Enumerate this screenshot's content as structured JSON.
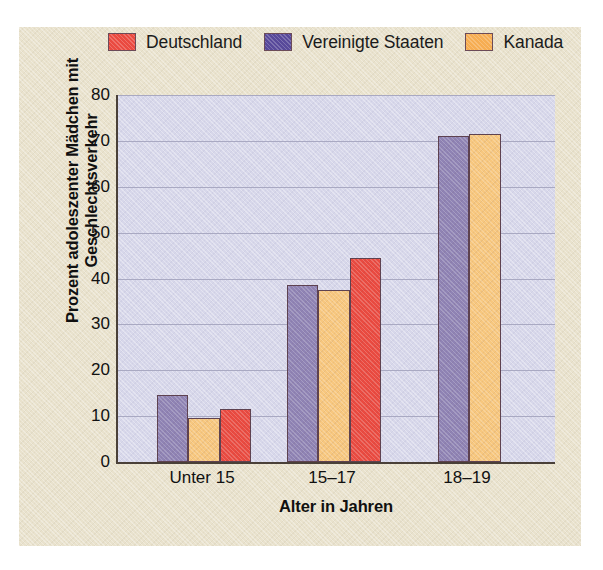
{
  "chart_data": {
    "type": "bar",
    "title": "",
    "xlabel": "Alter in Jahren",
    "ylabel_line1": "Prozent adoleszenter Mädchen mit",
    "ylabel_line2": "Geschlechtsverkehr",
    "categories": [
      "Unter 15",
      "15–17",
      "18–19"
    ],
    "yticks": [
      0,
      10,
      20,
      30,
      40,
      50,
      60,
      70,
      80
    ],
    "ylim": [
      0,
      80
    ],
    "grid": true,
    "legend_position": "top",
    "bar_order_in_group": [
      "Vereinigte Staaten",
      "Kanada",
      "Deutschland"
    ],
    "series": [
      {
        "name": "Deutschland",
        "color": "#ea4a40",
        "values": [
          11.5,
          44.5,
          null
        ]
      },
      {
        "name": "Vereinigte Staaten",
        "color": "#6b5aa0",
        "values": [
          14.5,
          38.5,
          71.0
        ]
      },
      {
        "name": "Kanada",
        "color": "#f4b25c",
        "values": [
          9.5,
          37.5,
          71.5
        ]
      }
    ]
  },
  "legend": {
    "items": [
      {
        "label": "Deutschland",
        "color": "#ea4a40"
      },
      {
        "label": "Vereinigte Staaten",
        "color": "#58499a"
      },
      {
        "label": "Kanada",
        "color": "#f6ad52"
      }
    ]
  },
  "axes": {
    "y_title_line1": "Prozent adoleszenter Mädchen mit",
    "y_title_line2": "Geschlechtsverkehr",
    "x_title": "Alter in Jahren",
    "y_ticks": [
      "80",
      "70",
      "60",
      "50",
      "40",
      "30",
      "20",
      "10",
      "0"
    ],
    "x_ticks": [
      "Unter 15",
      "15–17",
      "18–19"
    ]
  },
  "colors": {
    "panel_background": "#e9e2cd",
    "plot_background": "#d7d7ea",
    "axis_line": "#4a4038",
    "gridline": "#a9a9c2",
    "bar_outline": "#5e4250",
    "germany": "#ea4a40",
    "usa": "#8f83b4",
    "canada": "#f7c77e"
  }
}
